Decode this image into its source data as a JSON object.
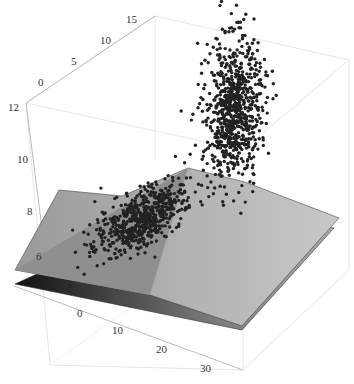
{
  "chart_data": {
    "type": "scatter3d",
    "title": "",
    "xlabel": "",
    "ylabel": "",
    "zlabel": "",
    "axes": {
      "x": {
        "ticks": [
          0,
          10,
          20,
          30
        ],
        "range": [
          -8,
          35
        ]
      },
      "y": {
        "ticks": [
          0,
          5,
          10,
          15
        ],
        "range": [
          -3,
          15
        ]
      },
      "z": {
        "ticks": [
          6,
          8,
          10,
          12
        ],
        "range": [
          5.5,
          12
        ]
      }
    },
    "series": [
      {
        "name": "cluster-low",
        "kind": "points",
        "color": "#222222",
        "center": {
          "x": 5,
          "y": 2,
          "z": 7
        },
        "approx_count": 1500,
        "shape": "elongated ellipse lying on plane"
      },
      {
        "name": "cluster-high",
        "kind": "points",
        "color": "#222222",
        "center": {
          "x": 25,
          "y": 10,
          "z": 10.5
        },
        "approx_count": 2000,
        "shape": "vertical ellipsoid above plane"
      }
    ],
    "surfaces": [
      {
        "name": "upper-plane",
        "kind": "plane",
        "fill": "#9a9a9a"
      },
      {
        "name": "lower-plane",
        "kind": "plane",
        "fill": "#555555"
      }
    ],
    "grid": false,
    "box": true,
    "legend": null
  },
  "labels": {
    "x_ticks": [
      "0",
      "10",
      "20",
      "30"
    ],
    "y_ticks": [
      "0",
      "5",
      "10",
      "15"
    ],
    "z_ticks": [
      "6",
      "8",
      "10",
      "12"
    ]
  }
}
